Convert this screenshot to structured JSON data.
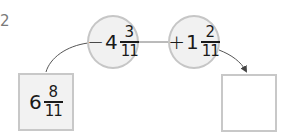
{
  "problem": {
    "number": "2"
  },
  "start_value": {
    "whole": "6",
    "numerator": "8",
    "denominator": "11"
  },
  "operations": [
    {
      "sign": "−",
      "whole": "4",
      "numerator": "3",
      "denominator": "11"
    },
    {
      "sign": "+",
      "whole": "1",
      "numerator": "2",
      "denominator": "11"
    }
  ],
  "answer": {
    "value": ""
  },
  "colors": {
    "text": "#1a1a1a",
    "label": "#7a7a7a",
    "border": "#c6c6c6",
    "fill": "#f1f1f1",
    "line": "#555555"
  }
}
